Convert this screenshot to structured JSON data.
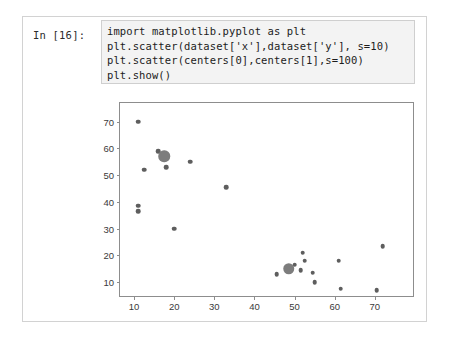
{
  "notebook": {
    "prompt_label": "In [16]:",
    "code_lines": [
      "import matplotlib.pyplot as plt",
      "plt.scatter(dataset['x'],dataset['y'], s=10)",
      "plt.scatter(centers[0],centers[1],s=100)",
      "plt.show()"
    ]
  },
  "colors": {
    "cell_border": "#d2d2d2",
    "code_background": "#f3f3f3",
    "code_border": "#cfcfcf",
    "code_text": "#1c1c1c",
    "axis": "#8d8d8d",
    "tick_label": "#3a3a3a",
    "point": "#5e5e5e",
    "centroid": "#7d7d7d",
    "figure_background": "#ffffff"
  },
  "chart_data": {
    "type": "scatter",
    "title": "",
    "xlabel": "",
    "ylabel": "",
    "xlim": [
      6.5,
      80.0
    ],
    "ylim": [
      4.0,
      77.0
    ],
    "xticks": [
      10,
      20,
      30,
      40,
      50,
      60,
      70
    ],
    "yticks": [
      10,
      20,
      30,
      40,
      50,
      60,
      70
    ],
    "grid": false,
    "legend": false,
    "series": [
      {
        "name": "dataset",
        "marker_size": 10,
        "marker_class": "small",
        "points": [
          [
            11.0,
            70.0
          ],
          [
            16.0,
            59.0
          ],
          [
            18.0,
            53.0
          ],
          [
            12.5,
            52.0
          ],
          [
            11.0,
            38.5
          ],
          [
            11.0,
            36.5
          ],
          [
            24.0,
            55.0
          ],
          [
            20.0,
            30.0
          ],
          [
            33.0,
            45.5
          ],
          [
            45.5,
            13.0
          ],
          [
            50.0,
            16.5
          ],
          [
            51.5,
            14.5
          ],
          [
            52.0,
            21.0
          ],
          [
            52.5,
            18.0
          ],
          [
            54.5,
            13.5
          ],
          [
            55.0,
            10.0
          ],
          [
            61.0,
            18.0
          ],
          [
            61.5,
            7.5
          ],
          [
            70.5,
            7.0
          ],
          [
            72.0,
            23.5
          ]
        ]
      },
      {
        "name": "centers",
        "marker_size": 100,
        "marker_class": "big",
        "points": [
          [
            17.5,
            57.0
          ],
          [
            48.5,
            15.0
          ]
        ]
      }
    ]
  }
}
